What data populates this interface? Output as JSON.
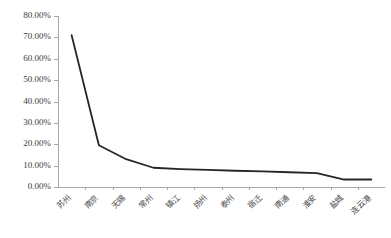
{
  "chart_data": {
    "type": "line",
    "title": "",
    "subtitle": "",
    "xlabel": "",
    "ylabel": "",
    "categories": [
      "苏州",
      "南京",
      "无锡",
      "常州",
      "镇江",
      "扬州",
      "泰州",
      "宿迁",
      "南通",
      "淮安",
      "盐城",
      "连云港"
    ],
    "values": [
      71.0,
      19.5,
      13.0,
      9.0,
      8.4,
      8.0,
      7.6,
      7.3,
      6.9,
      6.5,
      3.5,
      3.5
    ],
    "series": [
      {
        "name": "",
        "color": "#262626",
        "values": [
          71.0,
          19.5,
          13.0,
          9.0,
          8.4,
          8.0,
          7.6,
          7.3,
          6.9,
          6.5,
          3.5,
          3.5
        ]
      }
    ],
    "ylim": [
      0,
      80
    ],
    "ytick_step": 10,
    "ytick_labels": [
      "0.00%",
      "10.00%",
      "20.00%",
      "30.00%",
      "40.00%",
      "50.00%",
      "60.00%",
      "70.00%",
      "80.00%"
    ],
    "ytick_values": [
      0,
      10,
      20,
      30,
      40,
      50,
      60,
      70,
      80
    ],
    "grid": false,
    "legend": false,
    "legend_position": "none",
    "value_format": "percent",
    "xtick_rotation": -45,
    "axis_color": "#a8a8a8",
    "background_color": "#ffffff"
  },
  "layout": {
    "plot_left": 58,
    "plot_right": 385,
    "plot_top": 16,
    "plot_bottom": 187
  }
}
